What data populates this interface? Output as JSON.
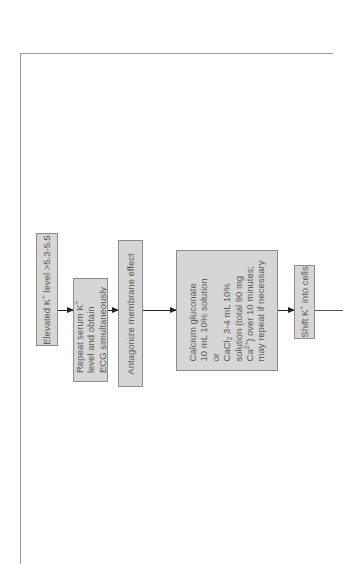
{
  "orientation": "rotated-90-ccw",
  "colors": {
    "box_fill": "#d6d6d6",
    "box_border": "#8c8c8c",
    "text": "#5a5a5a",
    "arrow": "#222222",
    "frame": "#9a9a9a"
  },
  "flowchart": {
    "nodes": [
      {
        "id": "elevated",
        "lines": [
          {
            "pre": "Elevated K",
            "sup": "+",
            "post": " level  >5.3-5.5"
          }
        ]
      },
      {
        "id": "repeat",
        "lines": [
          {
            "pre": "Repeat serum K",
            "sup": "+",
            "post": ""
          },
          {
            "pre": "level and obtain",
            "sup": "",
            "post": ""
          },
          {
            "pre": "ECG simultaneously",
            "sup": "",
            "post": ""
          }
        ]
      },
      {
        "id": "antagonize",
        "lines": [
          {
            "pre": "Antagonize membrane effect",
            "sup": "",
            "post": ""
          }
        ]
      },
      {
        "id": "calcium",
        "lines": [
          {
            "pre": "Calcium gluconate",
            "sup": "",
            "post": ""
          },
          {
            "pre": "10 mL 10% solution",
            "sup": "",
            "post": ""
          },
          {
            "pre": "or",
            "sup": "",
            "post": ""
          },
          {
            "pre": "CaCl",
            "sub": "2",
            "post": " 3-4 mL 10%"
          },
          {
            "pre": "solution (total 90 mg",
            "sup": "",
            "post": ""
          },
          {
            "pre": "Ca",
            "sup": "2+",
            "post": ") over 10 minutes;"
          },
          {
            "pre": "may repeat if necessary",
            "sup": "",
            "post": ""
          }
        ]
      },
      {
        "id": "shift",
        "lines": [
          {
            "pre": "Shift K",
            "sup": "+",
            "post": " into cells"
          }
        ]
      }
    ],
    "edges": [
      {
        "from": "elevated",
        "to": "repeat"
      },
      {
        "from": "repeat",
        "to": "antagonize"
      },
      {
        "from": "antagonize",
        "to": "calcium"
      },
      {
        "from": "calcium",
        "to": "shift"
      },
      {
        "from": "shift",
        "to": "continues-offpage"
      }
    ]
  }
}
